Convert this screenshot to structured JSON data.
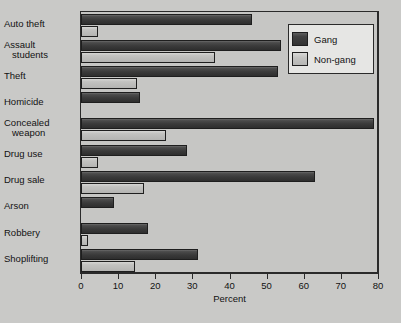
{
  "chart_data": {
    "type": "bar",
    "orientation": "horizontal",
    "title": "",
    "xlabel": "Percent",
    "ylabel": "",
    "xlim": [
      0,
      80
    ],
    "xticks": [
      0,
      10,
      20,
      30,
      40,
      50,
      60,
      70,
      80
    ],
    "xtick_labels": [
      "0",
      "10",
      "20",
      "30",
      "40",
      "50",
      "60",
      "70",
      "80"
    ],
    "grid": false,
    "legend_position": "top-right",
    "categories": [
      "Auto theft",
      "Assault\n  students",
      "Theft",
      "Homicide",
      "Concealed\n  weapon",
      "Drug use",
      "Drug sale",
      "Arson",
      "Robbery",
      "Shoplifting"
    ],
    "series": [
      {
        "name": "Gang",
        "color": "#3a3a3a",
        "values": [
          46,
          54,
          53,
          16,
          79,
          28.5,
          63,
          9,
          18,
          31.5
        ]
      },
      {
        "name": "Non-gang",
        "color": "#b6b6b4",
        "values": [
          4.5,
          36,
          15,
          0,
          23,
          4.5,
          17,
          0,
          2,
          14.5
        ]
      }
    ]
  },
  "legend": {
    "items": [
      {
        "label": "Gang",
        "swatch": "gang"
      },
      {
        "label": "Non-gang",
        "swatch": "nongang"
      }
    ]
  }
}
